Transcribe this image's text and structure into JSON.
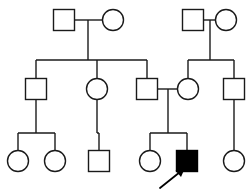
{
  "diagram": {
    "title": "Pedigree Chart",
    "type": "pedigree",
    "description": "Three-generation family pedigree with one affected male proband indicated by an arrow.",
    "width": 251,
    "height": 193,
    "colors": {
      "background": "#ffffff",
      "stroke": "#1a1a1a",
      "affected_fill": "#000000",
      "unaffected_fill": "#ffffff",
      "arrow": "#000000"
    },
    "legend": {
      "square_meaning": "male",
      "circle_meaning": "female",
      "filled_meaning": "affected",
      "open_meaning": "unaffected",
      "arrow_meaning": "proband"
    },
    "generations": [
      {
        "id": "I",
        "label": "I",
        "individuals": [
          {
            "id": "I-1",
            "sex": "male",
            "shape": "square",
            "affected": false,
            "cx": 64,
            "cy": 20,
            "size": 21
          },
          {
            "id": "I-2",
            "sex": "female",
            "shape": "circle",
            "affected": false,
            "cx": 113,
            "cy": 20,
            "size": 21
          },
          {
            "id": "I-3",
            "sex": "male",
            "shape": "square",
            "affected": false,
            "cx": 193,
            "cy": 20,
            "size": 21
          },
          {
            "id": "I-4",
            "sex": "female",
            "shape": "circle",
            "affected": false,
            "cx": 226,
            "cy": 20,
            "size": 21
          }
        ]
      },
      {
        "id": "II",
        "label": "II",
        "individuals": [
          {
            "id": "II-1",
            "sex": "male",
            "shape": "square",
            "affected": false,
            "cx": 36,
            "cy": 89,
            "size": 21
          },
          {
            "id": "II-2",
            "sex": "female",
            "shape": "circle",
            "affected": false,
            "cx": 97,
            "cy": 89,
            "size": 21
          },
          {
            "id": "II-3",
            "sex": "male",
            "shape": "square",
            "affected": false,
            "cx": 147,
            "cy": 89,
            "size": 21
          },
          {
            "id": "II-4",
            "sex": "female",
            "shape": "circle",
            "affected": false,
            "cx": 188,
            "cy": 89,
            "size": 21
          },
          {
            "id": "II-5",
            "sex": "male",
            "shape": "square",
            "affected": false,
            "cx": 234,
            "cy": 89,
            "size": 21
          }
        ]
      },
      {
        "id": "III",
        "label": "III",
        "individuals": [
          {
            "id": "III-1",
            "sex": "female",
            "shape": "circle",
            "affected": false,
            "cx": 18,
            "cy": 161,
            "size": 21
          },
          {
            "id": "III-2",
            "sex": "female",
            "shape": "circle",
            "affected": false,
            "cx": 55,
            "cy": 161,
            "size": 21
          },
          {
            "id": "III-3",
            "sex": "male",
            "shape": "square",
            "affected": false,
            "cx": 99,
            "cy": 161,
            "size": 21
          },
          {
            "id": "III-4",
            "sex": "female",
            "shape": "circle",
            "affected": false,
            "cx": 150,
            "cy": 161,
            "size": 21
          },
          {
            "id": "III-5",
            "sex": "male",
            "shape": "square",
            "affected": true,
            "cx": 187,
            "cy": 161,
            "size": 21,
            "proband": true
          },
          {
            "id": "III-6",
            "sex": "female",
            "shape": "circle",
            "affected": false,
            "cx": 234,
            "cy": 161,
            "size": 21
          }
        ]
      }
    ],
    "matings": [
      {
        "id": "mate-I-1-I-2",
        "partners": [
          "I-1",
          "I-2"
        ],
        "line_y": 20,
        "x1": 75,
        "x2": 102,
        "drop_x": 88
      },
      {
        "id": "mate-I-3-I-4",
        "partners": [
          "I-3",
          "I-4"
        ],
        "line_y": 20,
        "x1": 204,
        "x2": 215,
        "drop_x": 210
      },
      {
        "id": "mate-II-3-II-4",
        "partners": [
          "II-3",
          "II-4"
        ],
        "line_y": 89,
        "x1": 158,
        "x2": 177,
        "drop_x": 168
      }
    ],
    "sibships": [
      {
        "id": "sibship-I-1-I-2",
        "parents_mating": "mate-I-1-I-2",
        "sib_line_y": 60,
        "children": [
          "II-1",
          "II-2",
          "II-3"
        ]
      },
      {
        "id": "sibship-I-3-I-4",
        "parents_mating": "mate-I-3-I-4",
        "sib_line_y": 60,
        "children": [
          "II-4",
          "II-5"
        ]
      },
      {
        "id": "sibship-II-1",
        "parents_mating": "",
        "sib_line_y": 133,
        "children": [
          "III-1",
          "III-2"
        ]
      },
      {
        "id": "sibship-II-2",
        "parents_mating": "",
        "sib_line_y": 133,
        "children": [
          "III-3"
        ]
      },
      {
        "id": "sibship-II-3-II-4",
        "parents_mating": "mate-II-3-II-4",
        "sib_line_y": 133,
        "children": [
          "III-4",
          "III-5"
        ]
      },
      {
        "id": "sibship-II-5",
        "parents_mating": "",
        "sib_line_y": 133,
        "children": [
          "III-6"
        ]
      }
    ],
    "proband_arrow": {
      "id": "proband-arrow",
      "points_to": "III-5",
      "tail_x": 160,
      "tail_y": 189,
      "tip_x": 183,
      "tip_y": 170
    }
  }
}
